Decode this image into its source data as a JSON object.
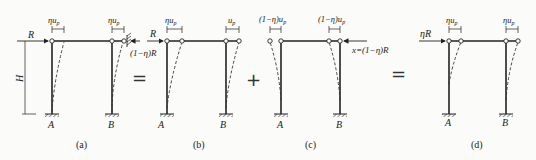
{
  "diagram": {
    "operators": [
      "=",
      "+",
      "="
    ],
    "panels": [
      {
        "id": "a",
        "caption": "(a)",
        "top_labels": [
          "ηu",
          "ηu"
        ],
        "top_subscript": "p",
        "force_left": "R",
        "force_right": "(1−η)R",
        "height_label": "H",
        "column_labels": [
          "A",
          "B"
        ]
      },
      {
        "id": "b",
        "caption": "(b)",
        "top_labels": [
          "ηu",
          "u"
        ],
        "top_subscript": "p",
        "force_left": "R",
        "force_left_extra": "(1−η)R",
        "column_labels": [
          "A",
          "B"
        ]
      },
      {
        "id": "c",
        "caption": "(c)",
        "top_labels": [
          "(1−η)u",
          "(1−η)u"
        ],
        "top_subscript": "p",
        "force_right": "x=(1−η)R",
        "column_labels": [
          "A",
          "B"
        ]
      },
      {
        "id": "d",
        "caption": "(d)",
        "top_labels": [
          "ηu",
          "ηu"
        ],
        "top_subscript": "p",
        "force_left": "ηR",
        "column_labels": [
          "A",
          "B"
        ]
      }
    ]
  }
}
